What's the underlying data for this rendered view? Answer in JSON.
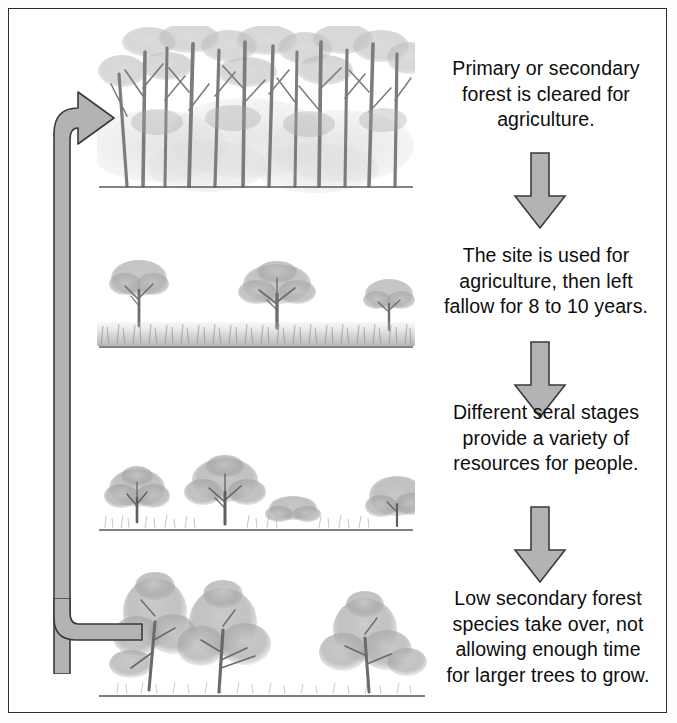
{
  "figure": {
    "type": "cycle-flow-diagram",
    "background_color": "#ffffff",
    "border_color": "#2b2b2b",
    "arrow_fill": "#b3b3b3",
    "arrow_stroke": "#3a3a3a",
    "sketch_color": "#9a9a9a",
    "trunk_color": "#6e6e6e",
    "ground_line_color": "#5a5a5a"
  },
  "stages": [
    {
      "id": "stage-1",
      "caption": "Primary or secondary\nforest is cleared for\nagriculture.",
      "illustration": "tall-dense-forest",
      "illustration_label": "Dense tall primary forest with many slender trunks"
    },
    {
      "id": "stage-2",
      "caption": "The site is used for\nagriculture, then left\nfallow for 8 to 10 years.",
      "illustration": "sparse-trees-grassland",
      "illustration_label": "Three isolated remnant trees above a grass field"
    },
    {
      "id": "stage-3",
      "caption": "Different seral stages\nprovide a variety of\nresources for people.",
      "illustration": "shrub-regrowth",
      "illustration_label": "Low shrubs and bushes of varying height regrowing"
    },
    {
      "id": "stage-4",
      "caption": "Low secondary forest\nspecies take over, not\nallowing enough time\nfor larger trees to grow.",
      "illustration": "low-secondary-forest",
      "illustration_label": "Medium secondary-forest trees with full crowns"
    }
  ],
  "connectors": [
    {
      "id": "arrow-1-2",
      "direction": "down",
      "from": "stage-1",
      "to": "stage-2"
    },
    {
      "id": "arrow-2-3",
      "direction": "down",
      "from": "stage-2",
      "to": "stage-3"
    },
    {
      "id": "arrow-3-4",
      "direction": "down",
      "from": "stage-3",
      "to": "stage-4"
    },
    {
      "id": "loop-back-arrow",
      "direction": "up-then-right",
      "from": "stage-4",
      "to": "stage-1"
    }
  ]
}
